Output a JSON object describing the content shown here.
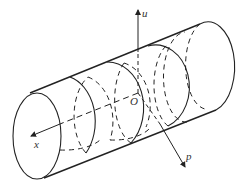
{
  "diagram": {
    "type": "cylinder-coordinate-diagram",
    "stroke_color": "#222222",
    "labels": {
      "u_axis": "u",
      "x_axis": "x",
      "origin": "O",
      "p_axis": "p"
    }
  }
}
